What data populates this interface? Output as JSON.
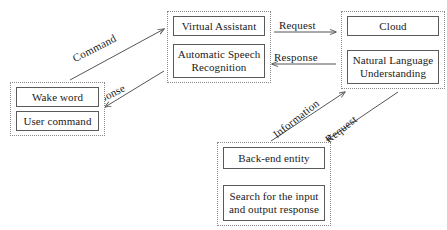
{
  "diagram": {
    "background_color": "#ffffff",
    "box_border_color": "#5a5a5a",
    "group_border_color": "#8a8a8a",
    "connector_color": "#555555",
    "text_color": "#1a1a1a"
  },
  "groups": [
    {
      "id": "user",
      "name": "user-group",
      "nodes": [
        {
          "label": "Wake word"
        },
        {
          "label": "User command"
        }
      ]
    },
    {
      "id": "virtual_assistant",
      "name": "virtual-assistant-group",
      "nodes": [
        {
          "label": "Virtual Assistant"
        },
        {
          "label": "Automatic Speech\nRecognition"
        }
      ]
    },
    {
      "id": "cloud",
      "name": "cloud-group",
      "nodes": [
        {
          "label": "Cloud"
        },
        {
          "label": "Natural Language\nUnderstanding"
        }
      ]
    },
    {
      "id": "backend",
      "name": "backend-group",
      "nodes": [
        {
          "label": "Back-end entity"
        },
        {
          "label": "Search for the input\nand output response"
        }
      ]
    }
  ],
  "edges": [
    {
      "id": "command",
      "label": "Command",
      "from": "user",
      "to": "virtual_assistant",
      "direction": "up-right"
    },
    {
      "id": "response_user",
      "label": "Response",
      "from": "virtual_assistant",
      "to": "user",
      "direction": "down-left"
    },
    {
      "id": "request_cloud",
      "label": "Request",
      "from": "virtual_assistant",
      "to": "cloud",
      "direction": "right"
    },
    {
      "id": "response_cloud",
      "label": "Response",
      "from": "cloud",
      "to": "virtual_assistant",
      "direction": "left"
    },
    {
      "id": "information",
      "label": "Information",
      "from": "backend",
      "to": "cloud",
      "direction": "up-right"
    },
    {
      "id": "request_backend",
      "label": "Request",
      "from": "cloud",
      "to": "backend",
      "direction": "down-left"
    }
  ]
}
